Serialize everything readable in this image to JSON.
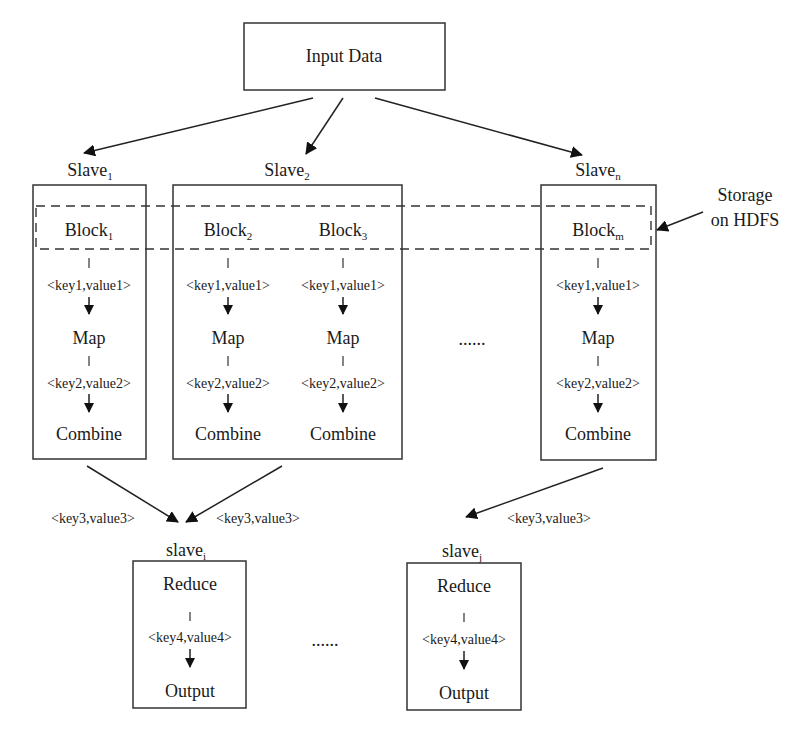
{
  "input": {
    "label": "Input Data"
  },
  "storage": {
    "line1": "Storage",
    "line2": "on HDFS"
  },
  "slaves": [
    {
      "name": "Slave",
      "sub": "1",
      "blocks": [
        {
          "name": "Block",
          "sub": "1"
        }
      ]
    },
    {
      "name": "Slave",
      "sub": "2",
      "blocks": [
        {
          "name": "Block",
          "sub": "2"
        },
        {
          "name": "Block",
          "sub": "3"
        }
      ]
    },
    {
      "name": "Slave",
      "sub": "n",
      "blocks": [
        {
          "name": "Block",
          "sub": "m"
        }
      ]
    }
  ],
  "map_stage": {
    "kv1": "<key1,value1>",
    "map": "Map",
    "kv2": "<key2,value2>",
    "combine": "Combine"
  },
  "ellipsis": "......",
  "shuffle": {
    "kv3": "<key3,value3>"
  },
  "reducers": [
    {
      "name": "slave",
      "sub": "i"
    },
    {
      "name": "slave",
      "sub": "j"
    }
  ],
  "reduce_stage": {
    "reduce": "Reduce",
    "kv4": "<key4,value4>",
    "output": "Output"
  }
}
